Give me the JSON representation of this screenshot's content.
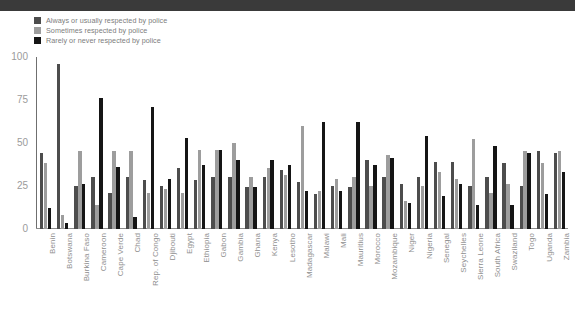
{
  "topbar": {
    "present": true,
    "color": "#3a3a3a"
  },
  "legend": {
    "items": [
      {
        "label": "Always or usually respected by police",
        "color": "#4d4d4d",
        "name": "legend-always-usually"
      },
      {
        "label": "Sometimes respected by police",
        "color": "#9d9d9d",
        "name": "legend-sometimes"
      },
      {
        "label": "Rarely or never respected by police",
        "color": "#151515",
        "name": "legend-rarely-never"
      }
    ]
  },
  "axis": {
    "yticks": [
      "100",
      "75",
      "50",
      "25",
      "0"
    ],
    "ytick_values": [
      100,
      75,
      50,
      25,
      0
    ],
    "ylabel": "",
    "xlabel": ""
  },
  "chart_data": {
    "type": "bar",
    "title": "",
    "subtitle": "",
    "xlabel": "",
    "ylabel": "",
    "ylim": [
      0,
      100
    ],
    "grid": false,
    "legend_position": "top-left",
    "categories": [
      "Benin",
      "Botswana",
      "Burkina Faso",
      "Cameroon",
      "Cape Verde",
      "Chad",
      "Rep. of Congo",
      "Djibouti",
      "Egypt",
      "Ethiopia",
      "Gabon",
      "Gambia",
      "Ghana",
      "Kenya",
      "Lesotho",
      "Madagascar",
      "Malawi",
      "Mali",
      "Mauritius",
      "Morocco",
      "Mozambique",
      "Niger",
      "Nigeria",
      "Senegal",
      "Seychelles",
      "Sierra Leone",
      "South Africa",
      "Swaziland",
      "Togo",
      "Uganda",
      "Zambia"
    ],
    "series": [
      {
        "name": "Always or usually respected by police",
        "color": "#4d4d4d",
        "values": [
          44,
          96,
          25,
          30,
          21,
          30,
          28,
          25,
          35,
          28,
          30,
          30,
          24,
          30,
          34,
          27,
          20,
          25,
          24,
          40,
          30,
          26,
          30,
          39,
          39,
          25,
          30,
          38,
          25,
          45,
          44
        ]
      },
      {
        "name": "Sometimes respected by police",
        "color": "#9d9d9d",
        "values": [
          38,
          8,
          45,
          14,
          45,
          45,
          21,
          23,
          21,
          46,
          46,
          50,
          30,
          35,
          31,
          60,
          22,
          29,
          30,
          25,
          43,
          16,
          25,
          33,
          29,
          52,
          21,
          26,
          45,
          38,
          45
        ]
      },
      {
        "name": "Rarely or never respected by police",
        "color": "#151515",
        "values": [
          12,
          3,
          26,
          76,
          36,
          7,
          71,
          29,
          53,
          37,
          46,
          40,
          24,
          40,
          37,
          22,
          62,
          22,
          62,
          37,
          41,
          15,
          54,
          19,
          26,
          14,
          48,
          14,
          44,
          20,
          33
        ]
      }
    ]
  }
}
